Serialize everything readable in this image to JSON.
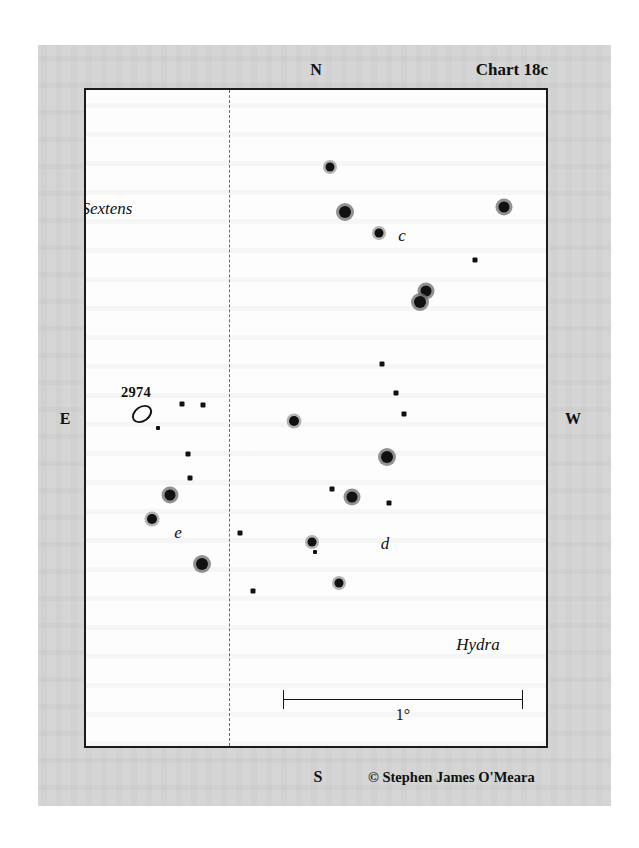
{
  "chart": {
    "id_label": "Chart 18c",
    "credit": "© Stephen James O'Meara",
    "cardinals": {
      "north": "N",
      "south": "S",
      "east": "E",
      "west": "W"
    },
    "scale": {
      "label": "1°"
    },
    "constellations": [
      {
        "name": "Sextens",
        "x": 105,
        "y": 207
      },
      {
        "name": "Hydra",
        "x": 476,
        "y": 643
      }
    ],
    "star_labels": [
      {
        "name": "c",
        "x": 400,
        "y": 234
      },
      {
        "name": "d",
        "x": 383,
        "y": 542
      },
      {
        "name": "e",
        "x": 176,
        "y": 531
      }
    ],
    "deep_sky_objects": [
      {
        "name": "2974",
        "label_x": 134,
        "label_y": 390,
        "x": 140,
        "y": 412,
        "rx": 9,
        "ry": 6
      }
    ]
  },
  "chart_data": {
    "type": "scatter",
    "title": "Chart 18c",
    "xlabel": "",
    "ylabel": "",
    "note": "Star chart of the Sextens / Hydra border region showing the galaxy NGC 2974 and field stars c, d and e. Positions given in screenshot pixel coordinates; size encodes visual magnitude (larger = brighter).",
    "frame": {
      "left": 84,
      "top": 88,
      "width": 464,
      "height": 660
    },
    "meridian_x": 227,
    "scale_bar": {
      "x1": 281,
      "x2": 521,
      "y": 697,
      "value": "1°"
    },
    "stars": [
      {
        "x": 328,
        "y": 165,
        "size": 9,
        "halo": true
      },
      {
        "x": 343,
        "y": 210,
        "size": 12,
        "halo": true
      },
      {
        "x": 377,
        "y": 231,
        "size": 9,
        "halo": true
      },
      {
        "x": 502,
        "y": 205,
        "size": 11,
        "halo": true
      },
      {
        "x": 473,
        "y": 258,
        "size": 5,
        "halo": false
      },
      {
        "x": 424,
        "y": 289,
        "size": 11,
        "halo": true
      },
      {
        "x": 418,
        "y": 300,
        "size": 12,
        "halo": true
      },
      {
        "x": 380,
        "y": 362,
        "size": 5,
        "halo": false
      },
      {
        "x": 394,
        "y": 391,
        "size": 5,
        "halo": false
      },
      {
        "x": 402,
        "y": 412,
        "size": 5,
        "halo": false
      },
      {
        "x": 292,
        "y": 419,
        "size": 10,
        "halo": true
      },
      {
        "x": 385,
        "y": 455,
        "size": 12,
        "halo": true
      },
      {
        "x": 330,
        "y": 487,
        "size": 5,
        "halo": false
      },
      {
        "x": 350,
        "y": 495,
        "size": 11,
        "halo": true
      },
      {
        "x": 387,
        "y": 501,
        "size": 5,
        "halo": false
      },
      {
        "x": 310,
        "y": 540,
        "size": 9,
        "halo": true
      },
      {
        "x": 313,
        "y": 550,
        "size": 4,
        "halo": false
      },
      {
        "x": 337,
        "y": 581,
        "size": 9,
        "halo": true
      },
      {
        "x": 180,
        "y": 402,
        "size": 5,
        "halo": false
      },
      {
        "x": 201,
        "y": 403,
        "size": 5,
        "halo": false
      },
      {
        "x": 156,
        "y": 426,
        "size": 4,
        "halo": false
      },
      {
        "x": 186,
        "y": 452,
        "size": 5,
        "halo": false
      },
      {
        "x": 188,
        "y": 476,
        "size": 5,
        "halo": false
      },
      {
        "x": 168,
        "y": 493,
        "size": 11,
        "halo": true
      },
      {
        "x": 150,
        "y": 517,
        "size": 10,
        "halo": true
      },
      {
        "x": 200,
        "y": 562,
        "size": 12,
        "halo": true
      },
      {
        "x": 238,
        "y": 531,
        "size": 5,
        "halo": false
      },
      {
        "x": 251,
        "y": 589,
        "size": 5,
        "halo": false
      }
    ]
  },
  "layout": {
    "cardinal_positions": {
      "north": {
        "x": 316,
        "y": 70
      },
      "south": {
        "x": 318,
        "y": 777
      },
      "east": {
        "x": 65,
        "y": 419
      },
      "west": {
        "x": 573,
        "y": 419
      }
    },
    "chart_id_position": {
      "x": 548,
      "y": 70
    },
    "credit_position": {
      "x": 368,
      "y": 777
    }
  }
}
